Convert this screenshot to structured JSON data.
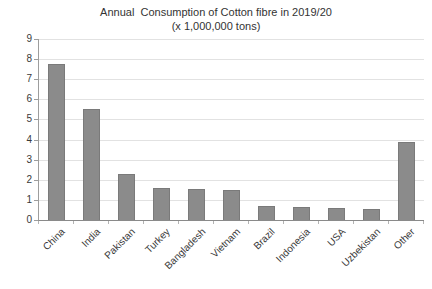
{
  "chart_data": {
    "type": "bar",
    "title": "Annual  Consumption of Cotton fibre in 2019/20",
    "subtitle": "(x 1,000,000 tons)",
    "xlabel": "",
    "ylabel": "",
    "categories": [
      "China",
      "India",
      "Pakistan",
      "Turkey",
      "Bangladesh",
      "Vietnam",
      "Brazil",
      "Indonesia",
      "USA",
      "Uzbekistan",
      "Other"
    ],
    "values": [
      7.75,
      5.5,
      2.3,
      1.6,
      1.55,
      1.5,
      0.7,
      0.65,
      0.6,
      0.55,
      3.9
    ],
    "ylim": [
      0,
      9
    ],
    "ytick_step": 1,
    "ytick_labels": [
      "0",
      "1",
      "2",
      "3",
      "4",
      "5",
      "6",
      "7",
      "8",
      "9"
    ],
    "grid": true,
    "legend": "none",
    "bar_color": "#8b8b8b",
    "bar_border_color": "#7a7a7a",
    "gridline_color": "#e2e2e2",
    "axis_color": "#9d9d9d",
    "text_color": "#3a3a3a"
  }
}
